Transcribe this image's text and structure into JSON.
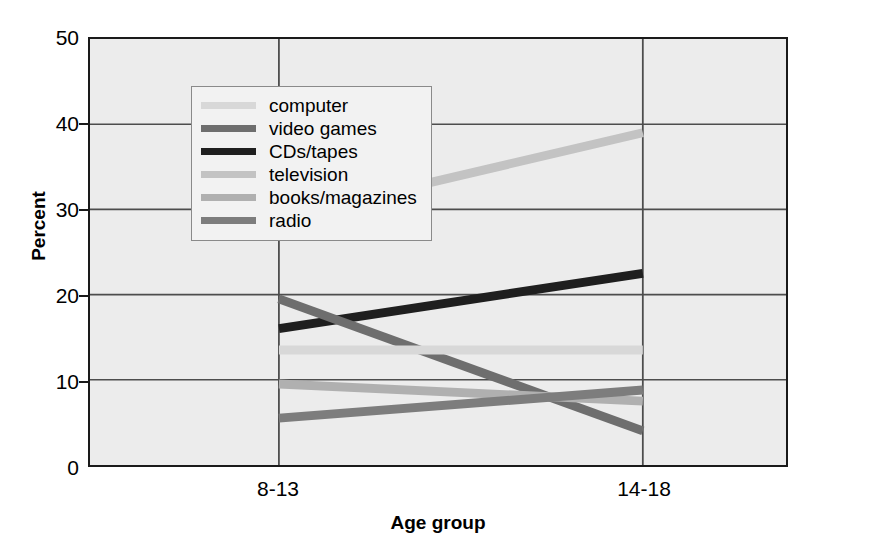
{
  "chart_data": {
    "type": "line",
    "title": "",
    "xlabel": "Age group",
    "ylabel": "Percent",
    "categories": [
      "8-13",
      "14-18"
    ],
    "x": [
      0,
      1
    ],
    "ylim": [
      0,
      50
    ],
    "yticks": [
      0,
      10,
      20,
      30,
      40,
      50
    ],
    "ytick_labels": [
      "0",
      "10",
      "20",
      "30",
      "40",
      "50"
    ],
    "grid": true,
    "legend_position": "upper left",
    "series": [
      {
        "name": "computer",
        "values": [
          13.5,
          13.5
        ],
        "color": "#d8d8d8"
      },
      {
        "name": "video games",
        "values": [
          19.5,
          4.0
        ],
        "color": "#6e6e6e"
      },
      {
        "name": "CDs/tapes",
        "values": [
          16.0,
          22.5
        ],
        "color": "#1f1f1f"
      },
      {
        "name": "television",
        "values": [
          29.0,
          39.0
        ],
        "color": "#c3c3c3"
      },
      {
        "name": "books/magazines",
        "values": [
          9.5,
          7.5
        ],
        "color": "#b0b0b0"
      },
      {
        "name": "radio",
        "values": [
          5.5,
          8.8
        ],
        "color": "#7d7d7d"
      }
    ]
  },
  "axes": {
    "y_title": "Percent",
    "x_title": "Age group",
    "y_tick_labels": [
      "50",
      "40",
      "30",
      "20",
      "10",
      "0"
    ],
    "x_tick_labels": [
      "8-13",
      "14-18"
    ]
  },
  "legend": {
    "items": [
      {
        "label": "computer",
        "swatch_color": "#d8d8d8"
      },
      {
        "label": "video games",
        "swatch_color": "#6e6e6e"
      },
      {
        "label": "CDs/tapes",
        "swatch_color": "#1f1f1f"
      },
      {
        "label": "television",
        "swatch_color": "#c3c3c3"
      },
      {
        "label": "books/magazines",
        "swatch_color": "#b0b0b0"
      },
      {
        "label": "radio",
        "swatch_color": "#7d7d7d"
      }
    ]
  },
  "style": {
    "plot_background": "#ececec",
    "frame_color": "#1a1a1a",
    "gridline_color": "#4d4d4d",
    "page_background": "#ffffff"
  }
}
